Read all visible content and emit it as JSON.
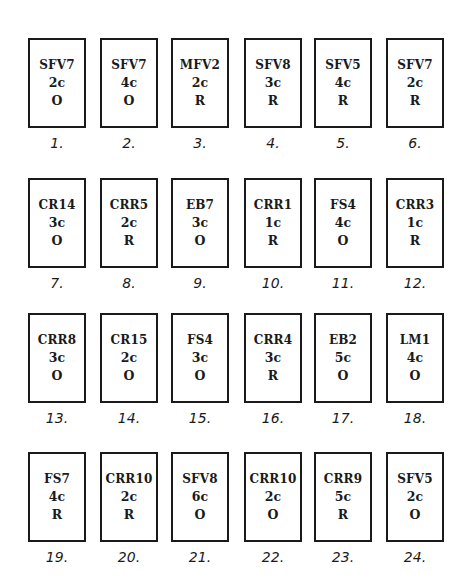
{
  "cards": [
    {
      "number": "1.",
      "code": "SFV7",
      "count": "2c",
      "type": "O"
    },
    {
      "number": "2.",
      "code": "SFV7",
      "count": "4c",
      "type": "O"
    },
    {
      "number": "3.",
      "code": "MFV2",
      "count": "2c",
      "type": "R"
    },
    {
      "number": "4.",
      "code": "SFV8",
      "count": "3c",
      "type": "R"
    },
    {
      "number": "5.",
      "code": "SFV5",
      "count": "4c",
      "type": "R"
    },
    {
      "number": "6.",
      "code": "SFV7",
      "count": "2c",
      "type": "R"
    },
    {
      "number": "7.",
      "code": "CR14",
      "count": "3c",
      "type": "O"
    },
    {
      "number": "8.",
      "code": "CRR5",
      "count": "2c",
      "type": "R"
    },
    {
      "number": "9.",
      "code": "EB7",
      "count": "3c",
      "type": "O"
    },
    {
      "number": "10.",
      "code": "CRR1",
      "count": "1c",
      "type": "R"
    },
    {
      "number": "11.",
      "code": "FS4",
      "count": "4c",
      "type": "O"
    },
    {
      "number": "12.",
      "code": "CRR3",
      "count": "1c",
      "type": "R"
    },
    {
      "number": "13.",
      "code": "CRR8",
      "count": "3c",
      "type": "O"
    },
    {
      "number": "14.",
      "code": "CR15",
      "count": "2c",
      "type": "O"
    },
    {
      "number": "15.",
      "code": "FS4",
      "count": "3c",
      "type": "O"
    },
    {
      "number": "16.",
      "code": "CRR4",
      "count": "3c",
      "type": "R"
    },
    {
      "number": "17.",
      "code": "EB2",
      "count": "5c",
      "type": "O"
    },
    {
      "number": "18.",
      "code": "LM1",
      "count": "4c",
      "type": "O"
    },
    {
      "number": "19.",
      "code": "FS7",
      "count": "4c",
      "type": "R"
    },
    {
      "number": "20.",
      "code": "CRR10",
      "count": "2c",
      "type": "R"
    },
    {
      "number": "21.",
      "code": "SFV8",
      "count": "6c",
      "type": "O"
    },
    {
      "number": "22.",
      "code": "CRR10",
      "count": "2c",
      "type": "O"
    },
    {
      "number": "23.",
      "code": "CRR9",
      "count": "5c",
      "type": "R"
    },
    {
      "number": "24.",
      "code": "SFV5",
      "count": "2c",
      "type": "O"
    }
  ]
}
